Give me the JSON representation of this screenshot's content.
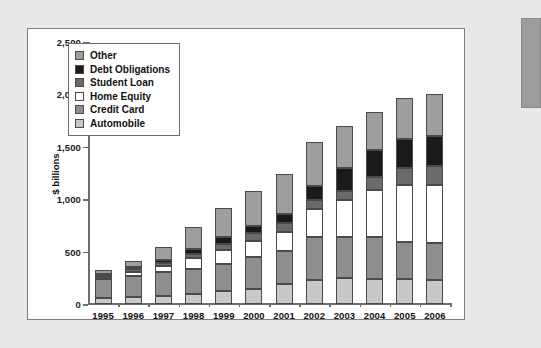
{
  "figure": {
    "background_color": "#e9e9e7",
    "panel_color": "#ffffff",
    "edge_tab_color": "#9d9d9d"
  },
  "chart_data": {
    "type": "bar",
    "stacked": true,
    "title": "",
    "xlabel": "",
    "ylabel": "$ billions",
    "ylim": [
      0,
      2500
    ],
    "yticks": [
      0,
      500,
      1000,
      1500,
      2000,
      2500
    ],
    "ytick_labels": [
      "0",
      "500",
      "1,000",
      "1,500",
      "2,000",
      "2,500"
    ],
    "grid": false,
    "legend_position": "upper-left",
    "categories": [
      "1995",
      "1996",
      "1997",
      "1998",
      "1999",
      "2000",
      "2001",
      "2002",
      "2003",
      "2004",
      "2005",
      "2006"
    ],
    "series": [
      {
        "name": "Automobile",
        "color": "#c8c8c8",
        "values": [
          60,
          70,
          80,
          95,
          120,
          140,
          195,
          225,
          245,
          240,
          235,
          225
        ]
      },
      {
        "name": "Credit Card",
        "color": "#8e8e8e",
        "values": [
          175,
          200,
          225,
          240,
          265,
          310,
          315,
          410,
          390,
          395,
          355,
          355
        ]
      },
      {
        "name": "Home Equity",
        "color": "#ffffff",
        "values": [
          20,
          35,
          55,
          100,
          130,
          150,
          180,
          275,
          355,
          450,
          545,
          560
        ]
      },
      {
        "name": "Student Loan",
        "color": "#6b6b6b",
        "values": [
          25,
          30,
          35,
          45,
          60,
          75,
          80,
          85,
          90,
          125,
          160,
          180
        ]
      },
      {
        "name": "Debt Obligations",
        "color": "#1a1a1a",
        "values": [
          10,
          15,
          25,
          45,
          60,
          65,
          85,
          135,
          215,
          260,
          275,
          285
        ]
      },
      {
        "name": "Other",
        "color": "#9e9e9e",
        "values": [
          35,
          60,
          120,
          210,
          280,
          340,
          385,
          420,
          405,
          365,
          400,
          395
        ]
      }
    ],
    "totals": [
      325,
      410,
      540,
      735,
      915,
      1080,
      1240,
      1550,
      1700,
      1835,
      1970,
      2000
    ],
    "legend_order_top_to_bottom": [
      "Other",
      "Debt Obligations",
      "Student Loan",
      "Home Equity",
      "Credit Card",
      "Automobile"
    ]
  }
}
